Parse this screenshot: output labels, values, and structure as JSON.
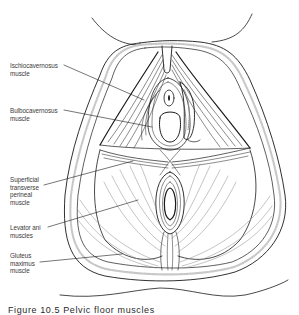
{
  "figure": {
    "labels": [
      {
        "id": "ischiocavernosus",
        "text": "Ischiocavernosus\nmuscle",
        "x": 10,
        "y": 62
      },
      {
        "id": "bulbocavernosus",
        "text": "Bulbocavernosus\nmuscle",
        "x": 10,
        "y": 107
      },
      {
        "id": "superficial-transverse-perineal",
        "text": "Superficial\ntransverse\nperineal\nmuscle",
        "x": 10,
        "y": 176
      },
      {
        "id": "levator-ani",
        "text": "Levator ani\nmuscles",
        "x": 10,
        "y": 224
      },
      {
        "id": "gluteus-maximus",
        "text": "Gluteus\nmaximus\nmuscle",
        "x": 10,
        "y": 252
      }
    ],
    "caption": "Figure 10.5   Pelvic floor muscles"
  },
  "colors": {
    "ink": "#1a1a1a",
    "light_ink": "#777777",
    "label_text": "#3a3a3a",
    "background": "#ffffff"
  }
}
